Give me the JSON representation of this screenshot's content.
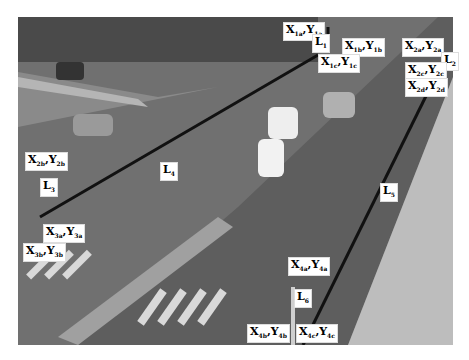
{
  "image": {
    "description": "Grayscale aerial view of a multi-lane road intersection with cars, crosswalks and annotated lane lines",
    "labels": [
      {
        "id": "x1a",
        "text": "X",
        "sub1": "1a",
        "text2": ",Y",
        "sub2": "1a",
        "x": 283,
        "y": 22
      },
      {
        "id": "l1",
        "text": "L",
        "sub1": "1",
        "x": 312,
        "y": 34
      },
      {
        "id": "x1b",
        "text": "X",
        "sub1": "1b",
        "text2": ",Y",
        "sub2": "1b",
        "x": 342,
        "y": 38
      },
      {
        "id": "x1c",
        "text": "X",
        "sub1": "1c",
        "text2": ",Y",
        "sub2": "1c",
        "x": 318,
        "y": 54
      },
      {
        "id": "x2a",
        "text": "X",
        "sub1": "2a",
        "text2": ",Y",
        "sub2": "2a",
        "x": 402,
        "y": 38
      },
      {
        "id": "l2",
        "text": "L",
        "sub1": "2",
        "x": 441,
        "y": 52
      },
      {
        "id": "x2c",
        "text": "X",
        "sub1": "2c",
        "text2": ",Y",
        "sub2": "2c",
        "x": 405,
        "y": 62
      },
      {
        "id": "x2d",
        "text": "X",
        "sub1": "2d",
        "text2": ",Y",
        "sub2": "2d",
        "x": 405,
        "y": 78
      },
      {
        "id": "x2b",
        "text": "X",
        "sub1": "2b",
        "text2": ",Y",
        "sub2": "2b",
        "x": 25,
        "y": 152
      },
      {
        "id": "l3",
        "text": "L",
        "sub1": "3",
        "x": 40,
        "y": 178
      },
      {
        "id": "l4",
        "text": "L",
        "sub1": "4",
        "x": 160,
        "y": 162
      },
      {
        "id": "x3a",
        "text": "X",
        "sub1": "3a",
        "text2": ",Y",
        "sub2": "3a",
        "x": 43,
        "y": 224
      },
      {
        "id": "x3b",
        "text": "X",
        "sub1": "3b",
        "text2": ",Y",
        "sub2": "3b",
        "x": 23,
        "y": 243
      },
      {
        "id": "l5",
        "text": "L",
        "sub1": "5",
        "x": 380,
        "y": 183
      },
      {
        "id": "x4a",
        "text": "X",
        "sub1": "4a",
        "text2": ",Y",
        "sub2": "4a",
        "x": 288,
        "y": 257
      },
      {
        "id": "l6",
        "text": "L",
        "sub1": "6",
        "x": 294,
        "y": 289
      },
      {
        "id": "x4b",
        "text": "X",
        "sub1": "4b",
        "text2": ",Y",
        "sub2": "4b",
        "x": 247,
        "y": 324
      },
      {
        "id": "x4c",
        "text": "X",
        "sub1": "4c",
        "text2": ",Y",
        "sub2": "4c",
        "x": 296,
        "y": 324
      }
    ]
  }
}
